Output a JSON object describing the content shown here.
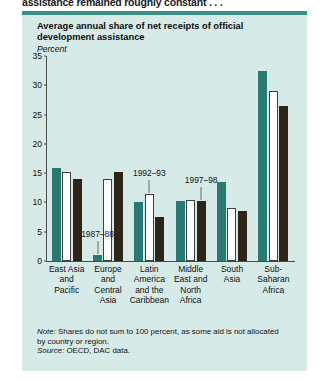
{
  "caption": "assistance remained roughly constant . . .",
  "panel": {
    "title": "Average annual share of net receipts of official development assistance",
    "subtitle": "Percent"
  },
  "note": {
    "note_label": "Note:",
    "note_text": " Shares do not sum to 100 percent, as some aid is not allocated by country or region.",
    "source_label": "Source:",
    "source_text": " OECD, DAC data."
  },
  "colors": {
    "panel_bg": "#d6ebe8",
    "rule": "#3c8f86",
    "series_1987_88": "#2a7a74",
    "series_1992_93": "#ffffff",
    "series_1997_98": "#2e2418"
  },
  "chart_data": {
    "type": "bar",
    "title": "Average annual share of net receipts of official development assistance",
    "xlabel": "",
    "ylabel": "Percent",
    "ylim": [
      0,
      35
    ],
    "yticks": [
      0,
      5,
      10,
      15,
      20,
      25,
      30,
      35
    ],
    "grid": false,
    "legend_position": "inline-annotations",
    "categories": [
      "East Asia and Pacific",
      "Europe and Central Asia",
      "Latin America and the Caribbean",
      "Middle East and North Africa",
      "South Asia",
      "Sub-Saharan Africa"
    ],
    "category_lines": [
      [
        "East Asia",
        "and",
        "Pacific"
      ],
      [
        "Europe",
        "and",
        "Central",
        "Asia"
      ],
      [
        "Latin",
        "America",
        "and the",
        "Caribbean"
      ],
      [
        "Middle",
        "East and",
        "North",
        "Africa"
      ],
      [
        "South",
        "Asia"
      ],
      [
        "Sub-",
        "Saharan",
        "Africa"
      ]
    ],
    "series": [
      {
        "name": "1987-88",
        "values": [
          15.8,
          1.0,
          10.0,
          10.2,
          13.5,
          32.5
        ]
      },
      {
        "name": "1992-93",
        "values": [
          15.2,
          14.0,
          11.5,
          10.5,
          9.0,
          29.0
        ]
      },
      {
        "name": "1997-98",
        "values": [
          14.0,
          15.2,
          7.5,
          10.2,
          8.5,
          26.5
        ]
      }
    ],
    "annotations": [
      {
        "label": "1987–88",
        "category": "Europe and Central Asia",
        "series": "1987-88"
      },
      {
        "label": "1992–93",
        "category": "Latin America and the Caribbean",
        "series": "1992-93"
      },
      {
        "label": "1997–98",
        "category": "Middle East and North Africa",
        "series": "1997-98"
      }
    ]
  }
}
